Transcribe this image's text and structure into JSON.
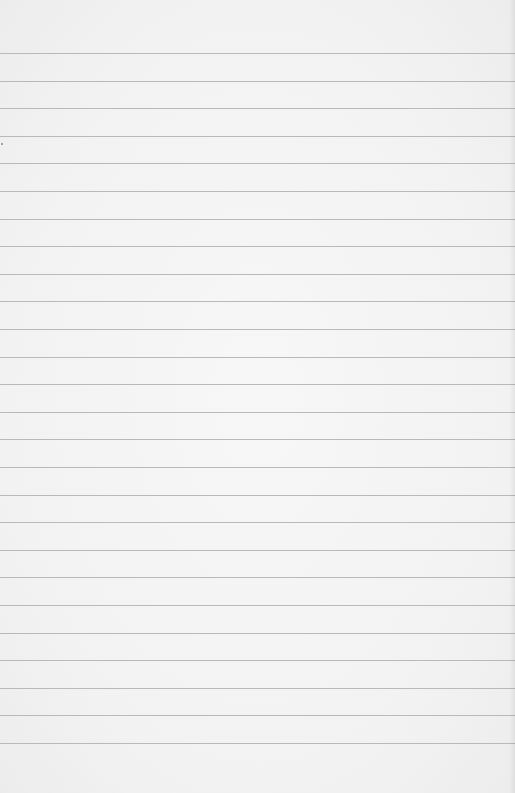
{
  "paper": {
    "type": "lined-paper",
    "background_color": "#f3f3f3",
    "line_color": "#b9b9b9",
    "first_line_y": 53,
    "line_spacing": 27.6,
    "line_count": 26
  }
}
